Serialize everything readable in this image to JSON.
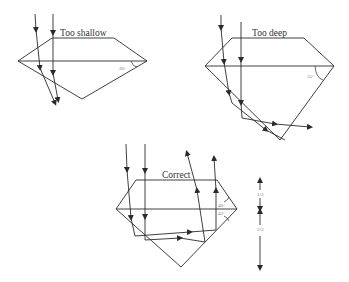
{
  "diagrams": [
    {
      "title": "Too shallow",
      "angle_label": "30°"
    },
    {
      "title": "Too deep",
      "angle_label": "55°"
    },
    {
      "title": "Correct",
      "angle_labels": [
        "40°",
        "42°"
      ]
    }
  ],
  "proportion_labels": [
    "1/3",
    "2/3"
  ],
  "colors": {
    "line": "#2a2a2a",
    "text": "#333333",
    "angle_text": "#777777"
  }
}
